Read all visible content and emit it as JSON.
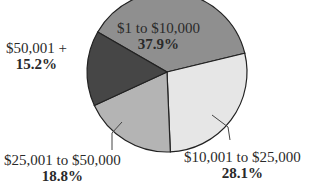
{
  "chart_data": {
    "type": "pie",
    "title": "",
    "slices": [
      {
        "label": "$1 to $10,000",
        "value": 37.9,
        "display": "37.9%",
        "color": "#8f8f8f"
      },
      {
        "label": "$10,001 to $25,000",
        "value": 28.1,
        "display": "28.1%",
        "color": "#e6e6e6"
      },
      {
        "label": "$25,001 to $50,000",
        "value": 18.8,
        "display": "18.8%",
        "color": "#b4b4b4"
      },
      {
        "label": "$50,001 +",
        "value": 15.2,
        "display": "15.2%",
        "color": "#464646"
      }
    ]
  }
}
